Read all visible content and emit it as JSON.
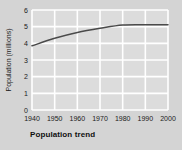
{
  "chart_data": {
    "type": "line",
    "title": "Population trend",
    "xlabel": "",
    "ylabel": "Population (millions)",
    "x": [
      1940,
      1950,
      1960,
      1970,
      1980,
      1990,
      2000
    ],
    "values": [
      3.85,
      4.3,
      4.65,
      4.9,
      5.1,
      5.12,
      5.12
    ],
    "series": [
      {
        "name": "Population",
        "values": [
          3.85,
          4.3,
          4.65,
          4.9,
          5.1,
          5.12,
          5.12
        ]
      }
    ],
    "xticklabels": [
      "1940",
      "1950",
      "1960",
      "1970",
      "1980",
      "1990",
      "2000"
    ],
    "yticklabels": [
      "0",
      "1",
      "2",
      "3",
      "4",
      "5",
      "6"
    ],
    "xlim": [
      1940,
      2000
    ],
    "ylim": [
      0,
      6
    ],
    "grid": true,
    "legend": false,
    "colors": {
      "line": "#4a4a4a",
      "plot_background": "#dcdcdc",
      "figure_background": "#d4d4d4",
      "gridline": "#ffffff",
      "text": "#1a1a1a"
    }
  }
}
